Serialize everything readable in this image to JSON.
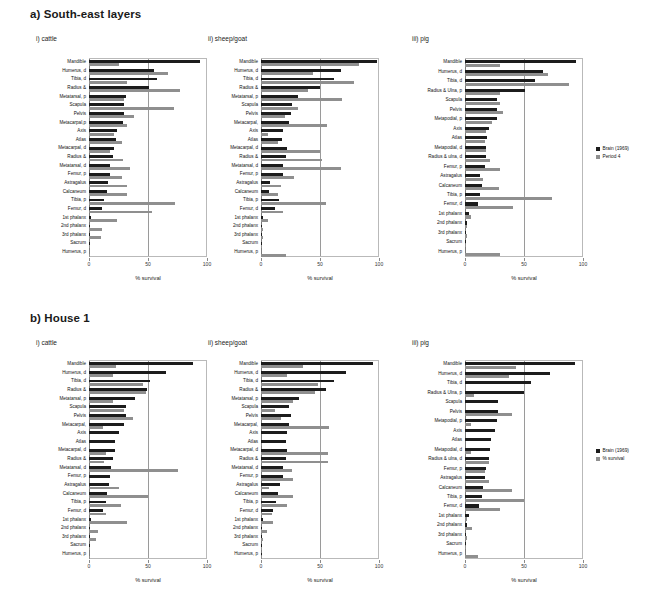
{
  "figure": {
    "panels": [
      {
        "key": "a",
        "title": "a) South-east layers"
      },
      {
        "key": "b",
        "title": "b) House 1"
      }
    ]
  },
  "axis": {
    "xlabel": "% survival",
    "ticks": [
      0,
      50,
      100
    ],
    "tick_labels": [
      "0",
      "50",
      "100"
    ],
    "xlim": [
      0,
      100
    ]
  },
  "colors": {
    "series1": "#1c1c1c",
    "series2": "#8f8f8f",
    "axis": "#7a7a7a",
    "grid": "#9a9a9a",
    "frame": "#b9b9b9"
  },
  "legends": {
    "a": {
      "items": [
        {
          "label": "Brain (1969)",
          "color": "#1c1c1c"
        },
        {
          "label": "Period 4",
          "color": "#8f8f8f"
        }
      ]
    },
    "b": {
      "items": [
        {
          "label": "Brain (1969)",
          "color": "#1c1c1c"
        },
        {
          "label": "% survival",
          "color": "#8f8f8f"
        }
      ]
    }
  },
  "chart_data": [
    {
      "id": "a-i",
      "type": "bar",
      "orientation": "horizontal",
      "title": "i) cattle",
      "panel": "a) South-east layers",
      "xlabel": "% survival",
      "ylabel": "",
      "xlim": [
        0,
        100
      ],
      "grid": true,
      "legend": [
        "Brain (1969)",
        "Period 4"
      ],
      "categories": [
        "Mandible",
        "Humerus, d",
        "Tibia, d",
        "Radius &",
        "Metatarsal, p",
        "Scapula",
        "Pelvis",
        "Metacarpal,p",
        "Axis",
        "Atlas",
        "Metacarpal, d",
        "Radius &",
        "Metatarsal, d",
        "Femur, p",
        "Astragalus",
        "Calcaneum",
        "Tibia, p",
        "Femur, d",
        "1st phalanx",
        "2nd phalanx",
        "3rd phalanx",
        "Sacrum",
        "Humerus, p"
      ],
      "series": [
        {
          "name": "Brain (1969)",
          "values": [
            94,
            55,
            58,
            51,
            31,
            30,
            30,
            29,
            24,
            23,
            21,
            20,
            18,
            18,
            16,
            15,
            13,
            11,
            2,
            1,
            1,
            1,
            0
          ]
        },
        {
          "name": "Period 4",
          "values": [
            25,
            67,
            32,
            77,
            30,
            72,
            38,
            32,
            21,
            28,
            18,
            29,
            35,
            28,
            32,
            32,
            73,
            53,
            24,
            11,
            10,
            1,
            1
          ]
        }
      ]
    },
    {
      "id": "a-ii",
      "type": "bar",
      "orientation": "horizontal",
      "title": "ii) sheep/goat",
      "panel": "a) South-east layers",
      "xlabel": "% survival",
      "ylabel": "",
      "xlim": [
        0,
        100
      ],
      "grid": true,
      "legend": [
        "Brain (1969)",
        "Period 4"
      ],
      "categories": [
        "Mandible",
        "Humerus, d",
        "Tibia, d",
        "Radius &",
        "Metatarsal, p",
        "Scapula",
        "Pelvis",
        "Metacarpal,",
        "Axis",
        "Atlas",
        "Metacarpal, d",
        "Radius &",
        "Metatarsal, d",
        "Femur, p",
        "Astragalus",
        "Calcaneum",
        "Tibia, p",
        "Femur, d",
        "1st phalanx",
        "2nd phalanx",
        "3rd phalanx",
        "Sacrum",
        "Humerus, p"
      ],
      "series": [
        {
          "name": "Brain (1969)",
          "values": [
            98,
            68,
            62,
            50,
            31,
            26,
            25,
            24,
            19,
            18,
            22,
            21,
            19,
            19,
            8,
            7,
            15,
            12,
            2,
            1,
            1,
            1,
            0
          ]
        },
        {
          "name": "Period 4",
          "values": [
            83,
            44,
            79,
            40,
            69,
            31,
            20,
            56,
            6,
            14,
            50,
            52,
            68,
            28,
            17,
            14,
            55,
            19,
            6,
            2,
            2,
            1,
            21
          ]
        }
      ]
    },
    {
      "id": "a-iii",
      "type": "bar",
      "orientation": "horizontal",
      "title": "iii) pig",
      "panel": "a) South-east layers",
      "xlabel": "% survival",
      "ylabel": "",
      "xlim": [
        0,
        100
      ],
      "grid": true,
      "legend": [
        "Brain (1969)",
        "Period 4"
      ],
      "categories": [
        "Mandible",
        "Humerus, d",
        "Tibia, d",
        "Radius & Ulna, p",
        "Scapula",
        "Pelvis",
        "Metapodial, p",
        "Axis",
        "Atlas",
        "Metapodial, d",
        "Radius & ulna, d",
        "Femur, p",
        "Astragalus",
        "Calcaneum",
        "Tibia, p",
        "Femur, d",
        "1st phalanx",
        "2nd phalanx",
        "3rd phalanx",
        "Sacrum",
        "Humerus, p"
      ],
      "series": [
        {
          "name": "Brain (1969)",
          "values": [
            94,
            66,
            59,
            51,
            27,
            27,
            27,
            20,
            19,
            18,
            18,
            17,
            13,
            14,
            13,
            11,
            3,
            2,
            1,
            1,
            0
          ]
        },
        {
          "name": "Period 4",
          "values": [
            30,
            70,
            88,
            30,
            30,
            32,
            23,
            18,
            17,
            18,
            21,
            30,
            15,
            29,
            74,
            41,
            5,
            2,
            2,
            1,
            30
          ]
        }
      ]
    },
    {
      "id": "b-i",
      "type": "bar",
      "orientation": "horizontal",
      "title": "i) cattle",
      "panel": "b) House 1",
      "xlabel": "% survival",
      "ylabel": "",
      "xlim": [
        0,
        100
      ],
      "grid": true,
      "legend": [
        "Brain (1969)",
        "% survival"
      ],
      "categories": [
        "Mandible",
        "Humerus, d",
        "Tibia, d",
        "Radius &",
        "Metatarsal, p",
        "Scapula",
        "Pelvis",
        "Metacarpal,",
        "Axis",
        "Atlas",
        "Metacarpal, d",
        "Radius &",
        "Metatarsal, d",
        "Femur, p",
        "Astragalus",
        "Calcaneum",
        "Tibia, p",
        "Femur, d",
        "1st phalanx",
        "2nd phalanx",
        "3rd phalanx",
        "Sacrum",
        "Humerus, p"
      ],
      "series": [
        {
          "name": "Brain (1969)",
          "values": [
            88,
            65,
            52,
            49,
            39,
            31,
            31,
            30,
            25,
            22,
            22,
            20,
            19,
            18,
            17,
            15,
            14,
            12,
            2,
            1,
            1,
            1,
            0
          ]
        },
        {
          "name": "% survival",
          "values": [
            23,
            20,
            46,
            48,
            20,
            30,
            37,
            12,
            0,
            0,
            14,
            13,
            75,
            0,
            25,
            50,
            27,
            14,
            32,
            8,
            6,
            1,
            1
          ]
        }
      ]
    },
    {
      "id": "b-ii",
      "type": "bar",
      "orientation": "horizontal",
      "title": "ii) sheep/goat",
      "panel": "b) House 1",
      "xlabel": "% survival",
      "ylabel": "",
      "xlim": [
        0,
        100
      ],
      "grid": true,
      "legend": [
        "Brain (1969)",
        "% survival"
      ],
      "categories": [
        "Mandible",
        "Humerus, d",
        "Tibia, d",
        "Radius &",
        "Metatarsal, p",
        "Scapula",
        "Pelvis",
        "Metacarpal,",
        "Axis",
        "Atlas",
        "Metacarpal, d",
        "Radius &",
        "Metatarsal, d",
        "Femur, p",
        "Astragalus",
        "Calcaneum",
        "Tibia, p",
        "Femur, d",
        "1st phalanx",
        "2nd phalanx",
        "3rd phalanx",
        "Sacrum",
        "Humerus, p"
      ],
      "series": [
        {
          "name": "Brain (1969)",
          "values": [
            95,
            72,
            62,
            55,
            32,
            24,
            25,
            24,
            22,
            21,
            22,
            21,
            19,
            19,
            16,
            14,
            13,
            10,
            2,
            1,
            1,
            1,
            1
          ]
        },
        {
          "name": "% survival",
          "values": [
            36,
            22,
            48,
            46,
            27,
            12,
            17,
            58,
            0,
            1,
            57,
            57,
            26,
            27,
            7,
            27,
            22,
            9,
            10,
            5,
            2,
            1,
            1
          ]
        }
      ]
    },
    {
      "id": "b-iii",
      "type": "bar",
      "orientation": "horizontal",
      "title": "iii) pig",
      "panel": "b) House 1",
      "xlabel": "% survival",
      "ylabel": "",
      "xlim": [
        0,
        100
      ],
      "grid": true,
      "legend": [
        "Brain (1969)",
        "% survival"
      ],
      "categories": [
        "Mandible",
        "Humerus, d",
        "Tibia, d",
        "Radius & Ulna, p",
        "Scapula",
        "Pelvis",
        "Metapodial, p",
        "Axis",
        "Atlas",
        "Metapodial, d",
        "Radius & ulna, d",
        "Femur, p",
        "Astragalus",
        "Calcaneum",
        "Tibia, p",
        "Femur, d",
        "1st phalanx",
        "2nd phalanx",
        "3rd phalanx",
        "Sacrum",
        "Humerus, p"
      ],
      "series": [
        {
          "name": "Brain (1969)",
          "values": [
            93,
            72,
            56,
            50,
            28,
            28,
            27,
            25,
            22,
            21,
            20,
            18,
            17,
            15,
            14,
            12,
            3,
            2,
            1,
            1,
            0
          ]
        },
        {
          "name": "% survival",
          "values": [
            43,
            37,
            0,
            8,
            0,
            40,
            5,
            0,
            0,
            5,
            20,
            17,
            20,
            40,
            50,
            30,
            2,
            6,
            2,
            1,
            11
          ]
        }
      ]
    }
  ]
}
